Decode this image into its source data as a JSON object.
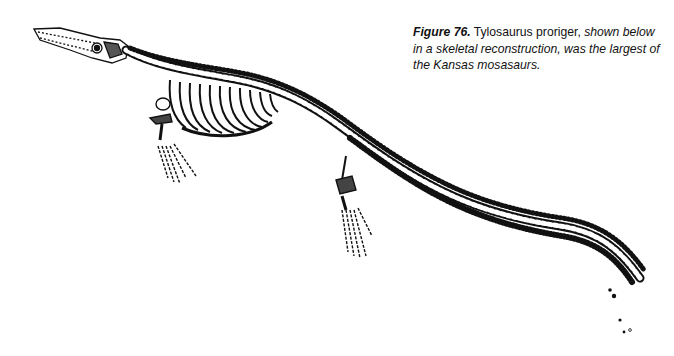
{
  "figure": {
    "label": "Figure 76.",
    "species": " Tylosaurus proriger,",
    "description": " shown below in a skeletal reconstruction, was the largest of the Kansas mosasaurs.",
    "illustration": "tylosaurus-proriger-skeleton",
    "colors": {
      "ink": "#111111",
      "background": "#ffffff"
    }
  }
}
